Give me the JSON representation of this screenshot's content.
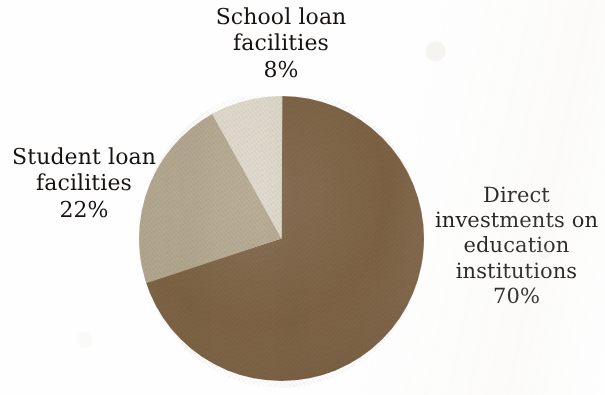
{
  "figure": {
    "name": "education-financing-pie-chart",
    "background_color": "#ffffff",
    "text_color": "#16120f"
  },
  "chart_data": {
    "type": "pie",
    "title": "",
    "subtitle": "",
    "xlabel": "",
    "ylabel": "",
    "grid": false,
    "legend_position": "none",
    "labels_position": "outside-callout-free",
    "start_angle_deg": 0,
    "direction": "clockwise",
    "center": {
      "x": 281,
      "y": 238
    },
    "radius": {
      "rx": 142,
      "ry": 142
    },
    "units": "percent",
    "total": 100,
    "categories": [
      "Direct investments on education institutions",
      "Student loan facilities",
      "School loan facilities"
    ],
    "values": [
      70,
      22,
      8
    ],
    "colors": [
      "#7d6244",
      "#b3a68e",
      "#ddd7c9"
    ],
    "slices": [
      {
        "name": "Direct investments on education institutions",
        "value": 70,
        "value_label": "70%",
        "color": "#7d6244",
        "start_deg": 0,
        "end_deg": 252,
        "label_lines": [
          "Direct",
          "investments on",
          "education",
          "institutions",
          "70%"
        ]
      },
      {
        "name": "Student loan facilities",
        "value": 22,
        "value_label": "22%",
        "color": "#b3a68e",
        "start_deg": 252,
        "end_deg": 331.2,
        "label_lines": [
          "Student loan",
          "facilities",
          "22%"
        ]
      },
      {
        "name": "School loan facilities",
        "value": 8,
        "value_label": "8%",
        "color": "#ddd7c9",
        "start_deg": 331.2,
        "end_deg": 360,
        "label_lines": [
          "School loan",
          "facilities",
          "8%"
        ]
      }
    ]
  },
  "labels": {
    "school": {
      "line1": "School loan",
      "line2": "facilities",
      "line3": "8%"
    },
    "student": {
      "line1": "Student loan",
      "line2": "facilities",
      "line3": "22%"
    },
    "direct": {
      "line1": "Direct",
      "line2": "investments on",
      "line3": "education",
      "line4": "institutions",
      "line5": "70%"
    }
  }
}
